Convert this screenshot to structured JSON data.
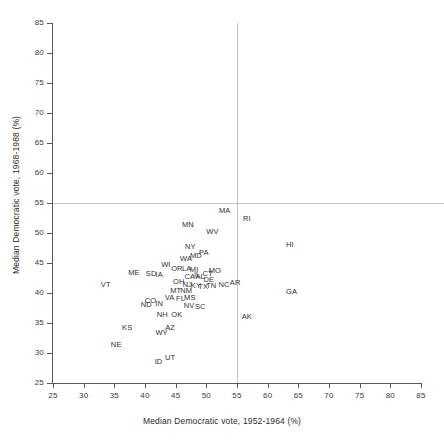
{
  "chart_data": {
    "type": "scatter",
    "title": "",
    "xlabel": "Median Democratic vote, 1952-1964 (%)",
    "ylabel": "Median Democratic vote, 1968-1988 (%)",
    "xlim": [
      25,
      85
    ],
    "ylim": [
      25,
      85
    ],
    "xticks": [
      25,
      30,
      35,
      40,
      45,
      50,
      55,
      60,
      65,
      70,
      75,
      80,
      85
    ],
    "yticks": [
      25,
      30,
      35,
      40,
      45,
      50,
      55,
      60,
      65,
      70,
      75,
      80,
      85
    ],
    "grid": false,
    "legend": null,
    "reference_lines": {
      "vertical_x": 55,
      "horizontal_y": 55,
      "color": "#c3c3c3"
    },
    "point_marker": "text-label",
    "label_color": "#2f2f2f",
    "points": [
      {
        "label": "MA",
        "x": 53.0,
        "y": 53.6
      },
      {
        "label": "RI",
        "x": 56.6,
        "y": 52.4
      },
      {
        "label": "MN",
        "x": 47.0,
        "y": 51.3
      },
      {
        "label": "WV",
        "x": 51.0,
        "y": 50.2
      },
      {
        "label": "HI",
        "x": 63.6,
        "y": 48.0
      },
      {
        "label": "NY",
        "x": 47.4,
        "y": 47.6
      },
      {
        "label": "PA",
        "x": 49.6,
        "y": 46.6
      },
      {
        "label": "MD",
        "x": 48.3,
        "y": 46.2
      },
      {
        "label": "WA",
        "x": 46.7,
        "y": 45.7
      },
      {
        "label": "WI",
        "x": 43.4,
        "y": 44.6
      },
      {
        "label": "OR",
        "x": 45.2,
        "y": 44.0
      },
      {
        "label": "LA",
        "x": 46.8,
        "y": 44.0
      },
      {
        "label": "MI",
        "x": 48.0,
        "y": 43.9
      },
      {
        "label": "MO",
        "x": 51.4,
        "y": 43.6
      },
      {
        "label": "ME",
        "x": 38.2,
        "y": 43.3
      },
      {
        "label": "SD",
        "x": 41.0,
        "y": 43.2
      },
      {
        "label": "IA",
        "x": 42.3,
        "y": 43.0
      },
      {
        "label": "IL",
        "x": 48.5,
        "y": 43.0
      },
      {
        "label": "CT",
        "x": 50.2,
        "y": 43.2
      },
      {
        "label": "CA",
        "x": 47.3,
        "y": 42.6
      },
      {
        "label": "AL",
        "x": 49.0,
        "y": 42.6
      },
      {
        "label": "DE",
        "x": 50.4,
        "y": 42.2
      },
      {
        "label": "OH",
        "x": 45.5,
        "y": 41.9
      },
      {
        "label": "VT",
        "x": 33.6,
        "y": 41.4
      },
      {
        "label": "NJ",
        "x": 46.9,
        "y": 41.3
      },
      {
        "label": "KY",
        "x": 48.3,
        "y": 41.2
      },
      {
        "label": "TX",
        "x": 49.5,
        "y": 41.0
      },
      {
        "label": "TN",
        "x": 50.8,
        "y": 41.1
      },
      {
        "label": "NC",
        "x": 52.9,
        "y": 41.4
      },
      {
        "label": "AR",
        "x": 54.7,
        "y": 41.6
      },
      {
        "label": "MT",
        "x": 45.0,
        "y": 40.3
      },
      {
        "label": "NM",
        "x": 46.7,
        "y": 40.3
      },
      {
        "label": "GA",
        "x": 63.9,
        "y": 40.1
      },
      {
        "label": "VA",
        "x": 44.0,
        "y": 39.2
      },
      {
        "label": "FL",
        "x": 45.8,
        "y": 39.0
      },
      {
        "label": "MS",
        "x": 47.3,
        "y": 39.1
      },
      {
        "label": "CO",
        "x": 40.9,
        "y": 38.7
      },
      {
        "label": "ND",
        "x": 40.2,
        "y": 38.0
      },
      {
        "label": "IN",
        "x": 42.3,
        "y": 38.1
      },
      {
        "label": "NV",
        "x": 47.2,
        "y": 37.8
      },
      {
        "label": "SC",
        "x": 49.0,
        "y": 37.7
      },
      {
        "label": "NH",
        "x": 42.8,
        "y": 36.4
      },
      {
        "label": "OK",
        "x": 45.2,
        "y": 36.4
      },
      {
        "label": "AK",
        "x": 56.6,
        "y": 36.0
      },
      {
        "label": "KS",
        "x": 37.1,
        "y": 34.1
      },
      {
        "label": "AZ",
        "x": 44.1,
        "y": 34.2
      },
      {
        "label": "WY",
        "x": 42.7,
        "y": 33.4
      },
      {
        "label": "NE",
        "x": 35.3,
        "y": 31.4
      },
      {
        "label": "UT",
        "x": 44.1,
        "y": 29.1
      },
      {
        "label": "ID",
        "x": 42.2,
        "y": 28.5
      }
    ]
  },
  "axes": {
    "x_title": "Median Democratic vote, 1952-1964 (%)",
    "y_title": "Median Democratic vote, 1968-1988 (%)"
  }
}
